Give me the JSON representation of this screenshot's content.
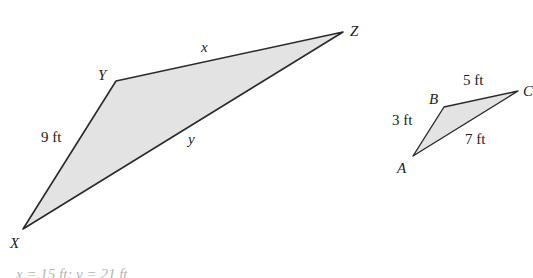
{
  "colors": {
    "fill": "#e3e3e3",
    "stroke": "#2a2a2a",
    "answer_text": "#b5b5b5"
  },
  "large_triangle": {
    "vertices": {
      "X": "X",
      "Y": "Y",
      "Z": "Z"
    },
    "sides": {
      "XY": "9 ft",
      "YZ": "x",
      "XZ": "y"
    }
  },
  "small_triangle": {
    "vertices": {
      "A": "A",
      "B": "B",
      "C": "C"
    },
    "sides": {
      "AB": "3 ft",
      "BC": "5 ft",
      "AC": "7 ft"
    }
  },
  "answer": "x = 15 ft; y = 21 ft"
}
